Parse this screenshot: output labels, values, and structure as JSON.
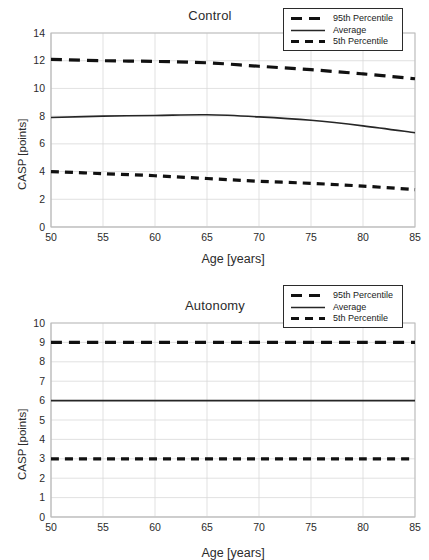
{
  "figure": {
    "width": 429,
    "height": 560,
    "background": "#ffffff",
    "line_color": "#111111",
    "grid_color": "#d9d9d9",
    "text_color": "#2b2b2b"
  },
  "legend": {
    "items": [
      {
        "label": "95th Percentile",
        "style": "dashed-long"
      },
      {
        "label": "Average",
        "style": "solid"
      },
      {
        "label": "5th Percentile",
        "style": "dashed-short"
      }
    ]
  },
  "chart_data": [
    {
      "type": "line",
      "title": "Control",
      "xlabel": "Age [years]",
      "ylabel": "CASP [points]",
      "xlim": [
        50,
        85
      ],
      "ylim": [
        0,
        14
      ],
      "xticks": [
        50,
        55,
        60,
        65,
        70,
        75,
        80,
        85
      ],
      "yticks": [
        0,
        2,
        4,
        6,
        8,
        10,
        12,
        14
      ],
      "grid": true,
      "legend_position": "top-right",
      "x": [
        50,
        55,
        60,
        65,
        70,
        75,
        80,
        85
      ],
      "series": [
        {
          "name": "95th Percentile",
          "style": "dashed-long",
          "values": [
            12.1,
            12.0,
            11.95,
            11.85,
            11.6,
            11.35,
            11.05,
            10.7
          ]
        },
        {
          "name": "Average",
          "style": "solid",
          "values": [
            7.9,
            8.0,
            8.05,
            8.1,
            7.95,
            7.7,
            7.3,
            6.8
          ]
        },
        {
          "name": "5th Percentile",
          "style": "dashed-short",
          "values": [
            4.0,
            3.85,
            3.7,
            3.5,
            3.3,
            3.15,
            2.95,
            2.7
          ]
        }
      ]
    },
    {
      "type": "line",
      "title": "Autonomy",
      "xlabel": "Age [years]",
      "ylabel": "CASP [points]",
      "xlim": [
        50,
        85
      ],
      "ylim": [
        0,
        10
      ],
      "xticks": [
        50,
        55,
        60,
        65,
        70,
        75,
        80,
        85
      ],
      "yticks": [
        0,
        1,
        2,
        3,
        4,
        5,
        6,
        7,
        8,
        9,
        10
      ],
      "grid": true,
      "legend_position": "top-right",
      "x": [
        50,
        55,
        60,
        65,
        70,
        75,
        80,
        85
      ],
      "series": [
        {
          "name": "95th Percentile",
          "style": "dashed-long",
          "values": [
            9.0,
            9.0,
            9.0,
            9.0,
            9.0,
            9.0,
            9.0,
            9.0
          ]
        },
        {
          "name": "Average",
          "style": "solid",
          "values": [
            6.0,
            6.0,
            6.0,
            6.0,
            6.0,
            6.0,
            6.0,
            6.0
          ]
        },
        {
          "name": "5th Percentile",
          "style": "dashed-short",
          "values": [
            3.0,
            3.0,
            3.0,
            3.0,
            3.0,
            3.0,
            3.0,
            3.0
          ]
        }
      ]
    }
  ]
}
